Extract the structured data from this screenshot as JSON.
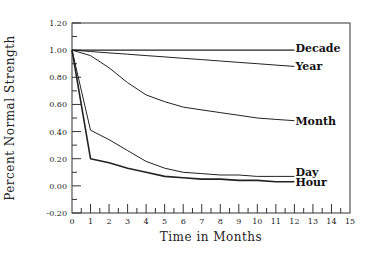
{
  "chart_data": {
    "type": "line",
    "title": "",
    "xlabel": "Time in Months",
    "ylabel": "Percent Normal Strength",
    "xlim": [
      0,
      15
    ],
    "ylim": [
      -0.2,
      1.2
    ],
    "x_ticks": [
      "0",
      "1",
      "2",
      "3",
      "4",
      "5",
      "6",
      "7",
      "8",
      "9",
      "10",
      "11",
      "12",
      "13",
      "14",
      "15"
    ],
    "y_ticks": [
      "-0.20",
      "0.00",
      "0.20",
      "0.40",
      "0.60",
      "0.80",
      "1.00",
      "1.20"
    ],
    "grid": false,
    "legend": "inline labels at line ends",
    "x": [
      0,
      1,
      2,
      3,
      4,
      5,
      6,
      7,
      8,
      9,
      10,
      11,
      12
    ],
    "series": [
      {
        "name": "Decade",
        "values": [
          1.0,
          1.0,
          1.0,
          1.0,
          1.0,
          1.0,
          1.0,
          1.0,
          1.0,
          1.0,
          1.0,
          1.0,
          1.0
        ]
      },
      {
        "name": "Year",
        "values": [
          1.0,
          0.99,
          0.98,
          0.97,
          0.96,
          0.95,
          0.94,
          0.93,
          0.92,
          0.91,
          0.9,
          0.89,
          0.88
        ]
      },
      {
        "name": "Month",
        "values": [
          1.0,
          0.96,
          0.87,
          0.76,
          0.67,
          0.62,
          0.58,
          0.56,
          0.54,
          0.52,
          0.5,
          0.49,
          0.48
        ]
      },
      {
        "name": "Day",
        "values": [
          1.0,
          0.41,
          0.34,
          0.26,
          0.18,
          0.13,
          0.1,
          0.09,
          0.08,
          0.08,
          0.07,
          0.07,
          0.07
        ]
      },
      {
        "name": "Hour",
        "values": [
          1.0,
          0.2,
          0.17,
          0.13,
          0.1,
          0.07,
          0.06,
          0.05,
          0.05,
          0.04,
          0.04,
          0.03,
          0.03
        ]
      }
    ]
  }
}
